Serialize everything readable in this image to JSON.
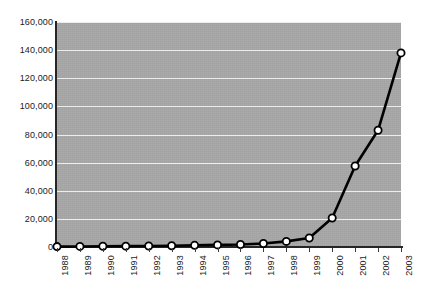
{
  "chart_data": {
    "type": "line",
    "title": "",
    "subtitle": "",
    "xlabel": "",
    "ylabel": "",
    "categories": [
      "1988",
      "1989",
      "1990",
      "1991",
      "1992",
      "1993",
      "1994",
      "1995",
      "1996",
      "1997",
      "1998",
      "1999",
      "2000",
      "2001",
      "2002",
      "2003"
    ],
    "values": [
      300,
      400,
      500,
      600,
      700,
      900,
      1200,
      1500,
      1800,
      2500,
      4000,
      6400,
      20600,
      57600,
      83000,
      138000
    ],
    "series": [
      {
        "name": "series-1",
        "values": [
          300,
          400,
          500,
          600,
          700,
          900,
          1200,
          1500,
          1800,
          2500,
          4000,
          6400,
          20600,
          57600,
          83000,
          138000
        ]
      }
    ],
    "ylim": [
      0,
      160000
    ],
    "ytick_values": [
      0,
      20000,
      40000,
      60000,
      80000,
      100000,
      120000,
      140000,
      160000
    ],
    "ytick_labels": [
      "0",
      "20,000",
      "40,000",
      "60,000",
      "80,000",
      "100,000",
      "120,000",
      "140,000",
      "160,000"
    ],
    "grid": true,
    "grid_axis": "y",
    "legend": false,
    "legend_position": "none",
    "annotations": []
  },
  "style": {
    "plot_background": "#a8a8a8",
    "page_background": "#ffffff",
    "gridline_color": "#ededed",
    "axis_color": "#262626",
    "line_color": "#000000",
    "marker_fill": "#ffffff",
    "marker_stroke": "#000000",
    "tick_label_color": "#1a1a1a"
  },
  "accessibility": {
    "chart_description": "Line chart showing near-zero values from 1988 through 1998 followed by exponential growth reaching about 138,000 in 2003."
  }
}
